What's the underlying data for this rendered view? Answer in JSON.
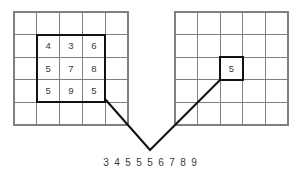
{
  "figure": {
    "background_color": "#ffffff",
    "grid_line_color": "#808080",
    "highlight_color": "#111111",
    "text_color": "#3a3a3a"
  },
  "input_grid": {
    "name": "input-image-grid",
    "rows": 5,
    "cols": 5,
    "x": 14,
    "y": 12,
    "cell_width": 22.8,
    "cell_height": 22.6,
    "highlight": {
      "start_row": 1,
      "start_col": 1,
      "rows": 3,
      "cols": 3
    },
    "values": [
      [
        "",
        "",
        "",
        "",
        ""
      ],
      [
        "",
        "4",
        "3",
        "6",
        ""
      ],
      [
        "",
        "5",
        "7",
        "8",
        ""
      ],
      [
        "",
        "5",
        "9",
        "5",
        ""
      ],
      [
        "",
        "",
        "",
        "",
        ""
      ]
    ]
  },
  "output_grid": {
    "name": "output-image-grid",
    "rows": 5,
    "cols": 5,
    "x": 175,
    "y": 12,
    "cell_width": 22.6,
    "cell_height": 22.6,
    "highlight": {
      "start_row": 2,
      "start_col": 2,
      "rows": 1,
      "cols": 1
    },
    "values": [
      [
        "",
        "",
        "",
        "",
        ""
      ],
      [
        "",
        "",
        "",
        "",
        ""
      ],
      [
        "",
        "",
        "5",
        "",
        ""
      ],
      [
        "",
        "",
        "",
        "",
        ""
      ],
      [
        "",
        "",
        "",
        "",
        ""
      ]
    ]
  },
  "connector": {
    "name": "v-connector",
    "left_start_x": 105,
    "left_start_y": 99,
    "apex_x": 150,
    "apex_y": 150,
    "right_start_x": 220,
    "right_start_y": 80
  },
  "sequence": {
    "name": "sorted-neighborhood-sequence",
    "label": "3 4 5 5 5 6 7 8 9",
    "digits": [
      "3",
      "4",
      "5",
      "5",
      "5",
      "6",
      "7",
      "8",
      "9"
    ],
    "median_index": 4,
    "median_value": "5",
    "center_x": 150,
    "y": 163,
    "digit_spacing": 11
  }
}
